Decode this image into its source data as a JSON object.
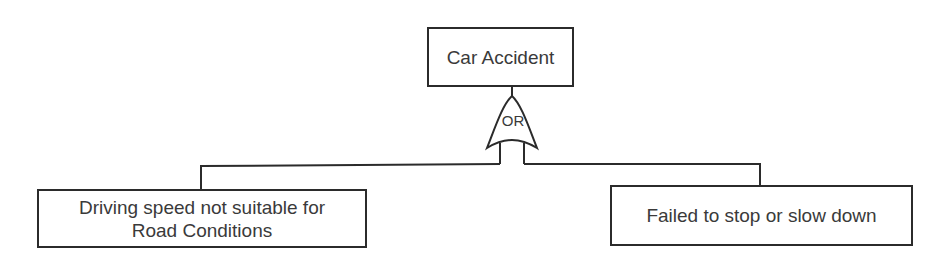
{
  "diagram": {
    "type": "fault-tree",
    "top_event": {
      "label": "Car Accident"
    },
    "gate": {
      "type": "OR",
      "label": "OR"
    },
    "children": [
      {
        "label": "Driving speed not suitable for Road Conditions",
        "lines": [
          "Driving speed not suitable for",
          "Road Conditions"
        ]
      },
      {
        "label": "Failed to stop or slow down"
      }
    ],
    "colors": {
      "stroke": "#2b2b2b",
      "text": "#3a3a3a",
      "background": "#ffffff"
    }
  }
}
